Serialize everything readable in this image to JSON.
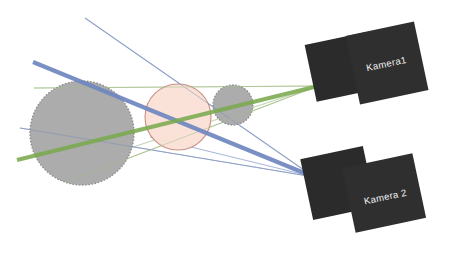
{
  "figure": {
    "kind": "stereo-camera-triangulation-diagram",
    "background_color": "#ffffff",
    "width": 461,
    "height": 269
  },
  "cameras": [
    {
      "id": "camera-1",
      "label": "Kamera1",
      "body_color": "#2b2b2b",
      "label_color": "#f2f2f2",
      "position": {
        "x": 372,
        "y": 68
      },
      "rotation_deg": -12,
      "panels": [
        {
          "name": "back-panel",
          "x": 310,
          "y": 38,
          "w": 62,
          "h": 58,
          "rotation_deg": -12
        },
        {
          "name": "front-panel",
          "x": 352,
          "y": 28,
          "w": 70,
          "h": 70,
          "rotation_deg": -12
        }
      ]
    },
    {
      "id": "camera-2",
      "label": "Kamera 2",
      "body_color": "#2b2b2b",
      "label_color": "#f2f2f2",
      "position": {
        "x": 371,
        "y": 196
      },
      "rotation_deg": -12,
      "panels": [
        {
          "name": "back-panel",
          "x": 306,
          "y": 152,
          "w": 64,
          "h": 62,
          "rotation_deg": -12
        },
        {
          "name": "front-panel",
          "x": 348,
          "y": 160,
          "w": 72,
          "h": 66,
          "rotation_deg": -12
        }
      ]
    }
  ],
  "targets": [
    {
      "id": "large-sphere",
      "shape": "circle",
      "cx": 82,
      "cy": 133,
      "r": 52,
      "fill": "#a8a8a8",
      "stroke": "#8f8f8f",
      "stroke_style": "dotted"
    },
    {
      "id": "center-sphere",
      "shape": "circle",
      "cx": 178,
      "cy": 117,
      "r": 33,
      "fill": "#fae0d6",
      "stroke": "#c99083",
      "stroke_style": "solid"
    },
    {
      "id": "small-sphere",
      "shape": "circle",
      "cx": 233,
      "cy": 105,
      "r": 20,
      "fill": "#a8a8a8",
      "stroke": "#8f8f8f",
      "stroke_style": "dotted"
    }
  ],
  "rays": [
    {
      "id": "ray-green-principal",
      "group": "camera-1",
      "color": "#7aaa4f",
      "width": 4.2,
      "x1": 17,
      "y1": 160,
      "x2": 318,
      "y2": 86,
      "kind": "principal-axis"
    },
    {
      "id": "ray-blue-principal",
      "group": "camera-2",
      "color": "#6f87bf",
      "width": 4.2,
      "x1": 33,
      "y1": 62,
      "x2": 314,
      "y2": 177,
      "kind": "principal-axis"
    },
    {
      "id": "ray-green-upper",
      "group": "camera-1",
      "color": "#b9cfa3",
      "width": 1.1,
      "x1": 34,
      "y1": 88,
      "x2": 318,
      "y2": 86,
      "kind": "sight-line"
    },
    {
      "id": "ray-green-lower",
      "group": "camera-1",
      "color": "#b9cfa3",
      "width": 1.1,
      "x1": 66,
      "y1": 182,
      "x2": 318,
      "y2": 86,
      "kind": "sight-line"
    },
    {
      "id": "ray-green-mid",
      "group": "camera-1",
      "color": "#b9cfa3",
      "width": 1.1,
      "x1": 124,
      "y1": 150,
      "x2": 318,
      "y2": 86,
      "kind": "sight-line"
    },
    {
      "id": "ray-blue-upper",
      "group": "camera-2",
      "color": "#9fb0d4",
      "width": 1.1,
      "x1": 85,
      "y1": 18,
      "x2": 314,
      "y2": 177,
      "kind": "sight-line"
    },
    {
      "id": "ray-blue-lower",
      "group": "camera-2",
      "color": "#9fb0d4",
      "width": 1.1,
      "x1": 20,
      "y1": 128,
      "x2": 314,
      "y2": 177,
      "kind": "sight-line"
    },
    {
      "id": "ray-blue-mid",
      "group": "camera-2",
      "color": "#9fb0d4",
      "width": 1.1,
      "x1": 150,
      "y1": 137,
      "x2": 314,
      "y2": 177,
      "kind": "sight-line"
    }
  ]
}
